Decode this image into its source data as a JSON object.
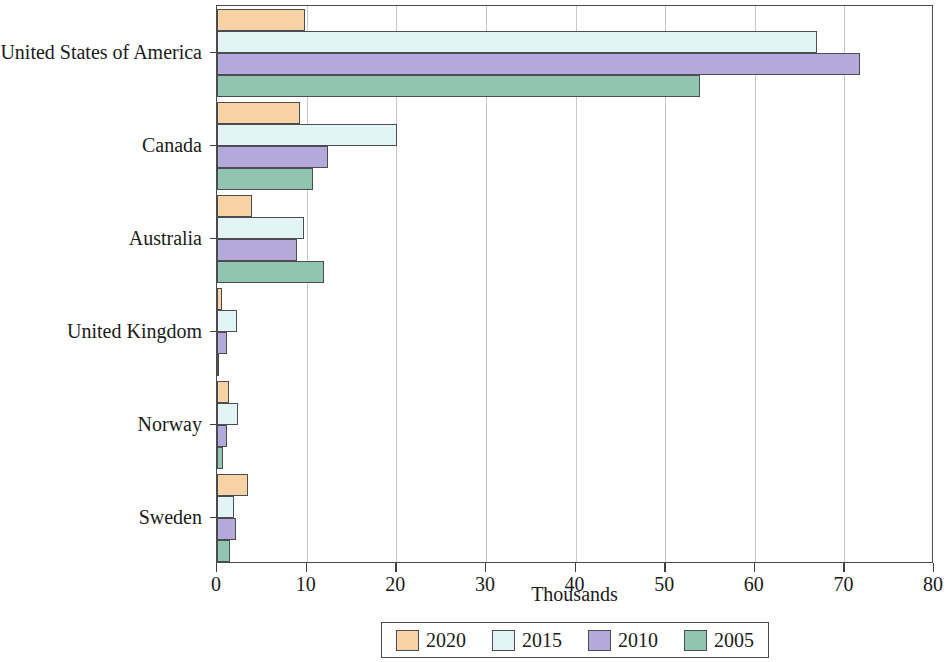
{
  "chart_data": {
    "type": "bar",
    "orientation": "horizontal",
    "title": "",
    "xlabel": "Thousands",
    "ylabel": "",
    "xlim": [
      0,
      80
    ],
    "xticks": [
      0,
      10,
      20,
      30,
      40,
      50,
      60,
      70,
      80
    ],
    "xticklabels": [
      "0",
      "10",
      "20",
      "30",
      "40",
      "50",
      "60",
      "70",
      "80"
    ],
    "grid": "vertical",
    "legend_position": "bottom",
    "categories": [
      "United States of America",
      "Canada",
      "Australia",
      "United Kingdom",
      "Norway",
      "Sweden"
    ],
    "series": [
      {
        "name": "2020",
        "color": "#f6d2a4",
        "values": [
          9.8,
          9.3,
          3.9,
          0.6,
          1.3,
          3.5
        ]
      },
      {
        "name": "2015",
        "color": "#e2f4f4",
        "values": [
          67.0,
          20.1,
          9.7,
          2.2,
          2.3,
          1.9
        ]
      },
      {
        "name": "2010",
        "color": "#b3aadb",
        "values": [
          71.7,
          12.4,
          8.9,
          1.1,
          1.1,
          2.1
        ]
      },
      {
        "name": "2005",
        "color": "#92c5b1",
        "values": [
          53.9,
          10.7,
          11.9,
          0.1,
          0.7,
          1.5
        ]
      }
    ]
  },
  "axis": {
    "x_title": "Thousands"
  },
  "legend": {
    "entries": [
      {
        "label": "2020",
        "color": "#f6d2a4"
      },
      {
        "label": "2015",
        "color": "#e2f4f4"
      },
      {
        "label": "2010",
        "color": "#b3aadb"
      },
      {
        "label": "2005",
        "color": "#92c5b1"
      }
    ]
  },
  "style": {
    "bar_edge_color": "#4c4c52",
    "frame_color": "#4a4a4a",
    "grid_color": "#c9c9c9",
    "text_color": "#1b1b1b"
  }
}
